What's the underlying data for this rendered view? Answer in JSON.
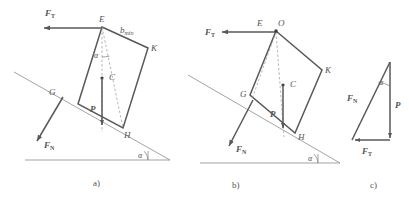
{
  "figure": {
    "stroke_color": "#5a585a",
    "thin_color": "#8d8b8d",
    "dash_color": "#9b999b"
  },
  "panels": [
    {
      "id": "a",
      "caption": "a)",
      "points": [
        {
          "name": "E",
          "label": "E"
        },
        {
          "name": "K",
          "label": "K"
        },
        {
          "name": "H",
          "label": "H"
        },
        {
          "name": "G",
          "label": "G"
        },
        {
          "name": "C",
          "label": "C"
        }
      ],
      "forces": [
        {
          "name": "tension",
          "symbol": "F",
          "subscript": "T"
        },
        {
          "name": "normal",
          "symbol": "F",
          "subscript": "N"
        },
        {
          "name": "weight",
          "symbol": "P",
          "subscript": ""
        }
      ],
      "dimensions": [
        {
          "name": "b-min",
          "symbol": "b",
          "subscript": "min"
        }
      ],
      "angles": [
        {
          "name": "alpha-at-top",
          "label": "α"
        },
        {
          "name": "alpha-at-base",
          "label": "α"
        }
      ]
    },
    {
      "id": "b",
      "caption": "b)",
      "points": [
        {
          "name": "E",
          "label": "E"
        },
        {
          "name": "O",
          "label": "O"
        },
        {
          "name": "K",
          "label": "K"
        },
        {
          "name": "H",
          "label": "H"
        },
        {
          "name": "G",
          "label": "G"
        },
        {
          "name": "C",
          "label": "C"
        }
      ],
      "forces": [
        {
          "name": "tension",
          "symbol": "F",
          "subscript": "T"
        },
        {
          "name": "normal",
          "symbol": "F",
          "subscript": "N"
        },
        {
          "name": "weight",
          "symbol": "P",
          "subscript": ""
        }
      ],
      "angles": [
        {
          "name": "alpha-at-base",
          "label": "α"
        }
      ]
    },
    {
      "id": "c",
      "caption": "c)",
      "forces": [
        {
          "name": "normal",
          "symbol": "F",
          "subscript": "N"
        },
        {
          "name": "weight",
          "symbol": "P",
          "subscript": ""
        },
        {
          "name": "tension",
          "symbol": "F",
          "subscript": "T"
        }
      ],
      "angles": [
        {
          "name": "alpha-apex",
          "label": "α"
        }
      ]
    }
  ],
  "labels": {
    "E": "E",
    "O": "O",
    "K": "K",
    "H": "H",
    "G": "G",
    "C": "C",
    "F": "F",
    "P": "P",
    "b": "b",
    "sub_T": "T",
    "sub_N": "N",
    "sub_min": "min",
    "alpha": "α",
    "cap_a": "a)",
    "cap_b": "b)",
    "cap_c": "c)"
  }
}
